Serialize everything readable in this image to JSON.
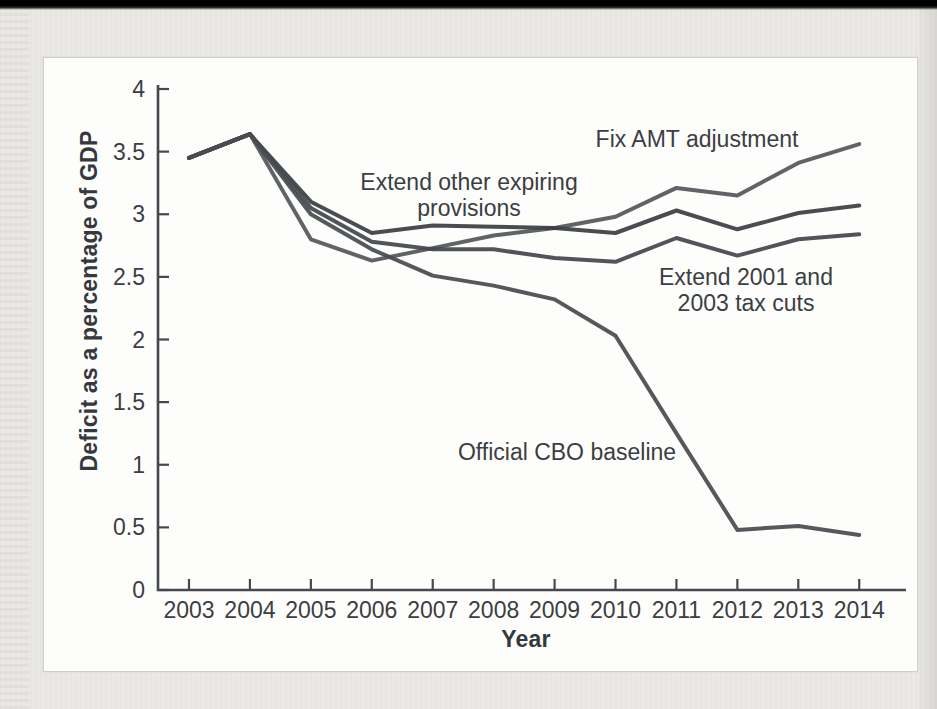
{
  "figure": {
    "y_axis_title": "Deficit as a percentage of GDP",
    "x_axis_title": "Year",
    "annotations": {
      "fix_amt": {
        "lines": [
          "Fix AMT adjustment"
        ]
      },
      "extend_other": {
        "lines": [
          "Extend other expiring",
          "provisions"
        ]
      },
      "extend_tax": {
        "lines": [
          "Extend 2001 and",
          "2003 tax cuts"
        ]
      },
      "cbo_baseline": {
        "lines": [
          "Official CBO baseline"
        ]
      }
    }
  },
  "chart_data": {
    "type": "line",
    "x": [
      2003,
      2004,
      2005,
      2006,
      2007,
      2008,
      2009,
      2010,
      2011,
      2012,
      2013,
      2014
    ],
    "x_tick_labels": [
      "2003",
      "2004",
      "2005",
      "2006",
      "2007",
      "2008",
      "2009",
      "2010",
      "2011",
      "2012",
      "2013",
      "2014"
    ],
    "y_tick_labels": [
      "0",
      "0.5",
      "1",
      "1.5",
      "2",
      "2.5",
      "3",
      "3.5",
      "4"
    ],
    "ylim": [
      0,
      4
    ],
    "grid": false,
    "legend": "inline-annotations",
    "xlabel": "Year",
    "ylabel": "Deficit as a percentage of GDP",
    "axis_color": "#45484c",
    "series": [
      {
        "id": "fix-amt",
        "name": "Fix AMT adjustment",
        "color": "#55585b",
        "values": [
          3.45,
          3.64,
          2.8,
          2.63,
          2.73,
          2.83,
          2.89,
          2.98,
          3.21,
          3.15,
          3.41,
          3.56
        ]
      },
      {
        "id": "extend-other",
        "name": "Extend other expiring provisions",
        "color": "#3c4043",
        "values": [
          3.45,
          3.64,
          3.1,
          2.85,
          2.91,
          2.9,
          2.89,
          2.85,
          3.03,
          2.88,
          3.01,
          3.07
        ]
      },
      {
        "id": "extend-tax",
        "name": "Extend 2001 and 2003 tax cuts",
        "color": "#44474b",
        "values": [
          3.45,
          3.64,
          3.05,
          2.78,
          2.72,
          2.72,
          2.65,
          2.62,
          2.81,
          2.67,
          2.8,
          2.84
        ]
      },
      {
        "id": "cbo-baseline",
        "name": "Official CBO baseline",
        "color": "#494c50",
        "values": [
          3.45,
          3.64,
          3.0,
          2.72,
          2.51,
          2.43,
          2.32,
          2.03,
          1.25,
          0.48,
          0.51,
          0.44
        ]
      }
    ]
  }
}
